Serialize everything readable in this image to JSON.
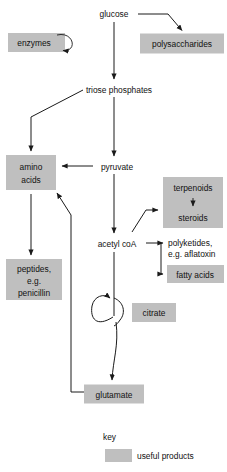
{
  "diagram": {
    "colors": {
      "shade": "#bfbfbf",
      "stroke": "#1a1a1a",
      "text": "#111111",
      "background": "#ffffff"
    },
    "nodes": {
      "glucose": {
        "label": "glucose",
        "shaded": false
      },
      "polysaccharides": {
        "label": "polysaccharides",
        "shaded": true
      },
      "enzymes": {
        "label": "enzymes",
        "shaded": true
      },
      "triose_phosphates": {
        "label": "triose phosphates",
        "shaded": false
      },
      "pyruvate": {
        "label": "pyruvate",
        "shaded": false
      },
      "amino_acids_line1": {
        "label": "amino",
        "shaded": true
      },
      "amino_acids_line2": {
        "label": "acids",
        "shaded": true
      },
      "terpenoids": {
        "label": "terpenoids",
        "shaded": true
      },
      "steroids": {
        "label": "steroids",
        "shaded": true
      },
      "acetyl_coa": {
        "label": "acetyl coA",
        "shaded": false
      },
      "polyketides_line1": {
        "label": "polyketides,",
        "shaded": false
      },
      "polyketides_line2": {
        "label": "e.g. aflatoxin",
        "shaded": false
      },
      "fatty_acids": {
        "label": "fatty acids",
        "shaded": true
      },
      "peptides_line1": {
        "label": "peptides,",
        "shaded": true
      },
      "peptides_line2": {
        "label": "e.g.",
        "shaded": true
      },
      "peptides_line3": {
        "label": "penicillin",
        "shaded": true
      },
      "citrate": {
        "label": "citrate",
        "shaded": true
      },
      "glutamate": {
        "label": "glutamate",
        "shaded": true
      }
    },
    "key": {
      "title": "key",
      "swatch_label": "useful products"
    }
  }
}
